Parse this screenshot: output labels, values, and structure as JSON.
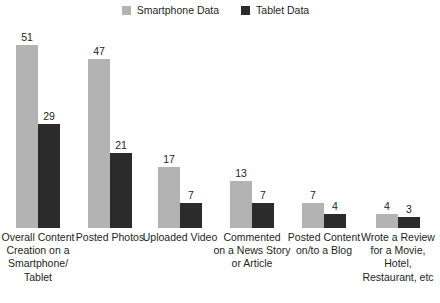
{
  "chart_data": {
    "type": "bar",
    "title": "",
    "subtitle": "",
    "xlabel": "",
    "ylabel": "",
    "ylim": [
      0,
      51
    ],
    "grid": false,
    "legend_position": "top-center",
    "categories": [
      "Overall Content Creation on a Smartphone/ Tablet",
      "Posted Photos",
      "Uploaded Video",
      "Commented on a News Story or Article",
      "Posted Content on/to a Blog",
      "Wrote a Review for a Movie, Hotel, Restaurant, etc"
    ],
    "category_lines": [
      [
        "Overall Content",
        "Creation on a",
        "Smartphone/",
        "Tablet"
      ],
      [
        "Posted Photos"
      ],
      [
        "Uploaded Video"
      ],
      [
        "Commented",
        "on a News Story",
        "or Article"
      ],
      [
        "Posted Content",
        "on/to a Blog"
      ],
      [
        "Wrote a Review",
        "for a Movie,",
        "Hotel,",
        "Restaurant, etc"
      ]
    ],
    "series": [
      {
        "name": "Smartphone Data",
        "color": "#b3b3b3",
        "values": [
          51,
          47,
          17,
          13,
          7,
          4
        ]
      },
      {
        "name": "Tablet Data",
        "color": "#2b2b2b",
        "values": [
          29,
          21,
          7,
          7,
          4,
          3
        ]
      }
    ]
  },
  "legend": {
    "items": [
      {
        "label": "Smartphone Data",
        "swatch": "legend-swatch-smartphone",
        "color": "#b3b3b3"
      },
      {
        "label": "Tablet Data",
        "swatch": "legend-swatch-tablet",
        "color": "#2b2b2b"
      }
    ]
  },
  "colors": {
    "background": "#ffffff",
    "text": "#231f20",
    "smartphone": "#b3b3b3",
    "tablet": "#2b2b2b"
  }
}
